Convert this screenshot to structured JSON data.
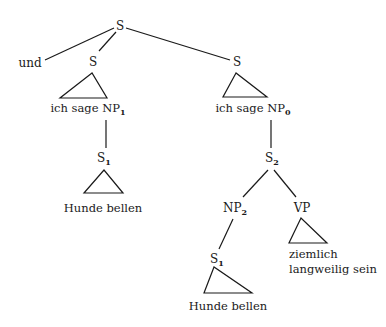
{
  "diagram": {
    "type": "syntax-tree",
    "nodes": {
      "root": {
        "label": "S"
      },
      "conj": {
        "label": "und"
      },
      "s_left": {
        "label": "S"
      },
      "s_right": {
        "label": "S"
      },
      "left_clause": {
        "label": "ich sage NP",
        "sub": "1"
      },
      "right_clause": {
        "label": "ich sage NP",
        "sub": "0"
      },
      "s1_upper": {
        "label": "S",
        "sub": "1"
      },
      "leaf_upper": {
        "label": "Hunde bellen"
      },
      "s2": {
        "label": "S",
        "sub": "2"
      },
      "np2": {
        "label": "NP",
        "sub": "2"
      },
      "vp": {
        "label": "VP"
      },
      "s1_lower": {
        "label": "S",
        "sub": "1"
      },
      "leaf_lower": {
        "label": "Hunde bellen"
      },
      "vp_leaf_line1": {
        "label": "ziemlich"
      },
      "vp_leaf_line2": {
        "label": "langweilig sein"
      }
    },
    "edges": [
      [
        "root",
        "conj"
      ],
      [
        "root",
        "s_left"
      ],
      [
        "root",
        "s_right"
      ],
      [
        "s_left",
        "left_clause",
        "triangle"
      ],
      [
        "s_right",
        "right_clause",
        "triangle"
      ],
      [
        "left_clause",
        "s1_upper"
      ],
      [
        "s1_upper",
        "leaf_upper",
        "triangle"
      ],
      [
        "right_clause",
        "s2"
      ],
      [
        "s2",
        "np2"
      ],
      [
        "s2",
        "vp"
      ],
      [
        "np2",
        "s1_lower"
      ],
      [
        "s1_lower",
        "leaf_lower",
        "triangle"
      ],
      [
        "vp",
        "vp_leaf",
        "triangle"
      ]
    ],
    "colors": {
      "ink": "#1a1a1a",
      "background": "#ffffff"
    }
  }
}
